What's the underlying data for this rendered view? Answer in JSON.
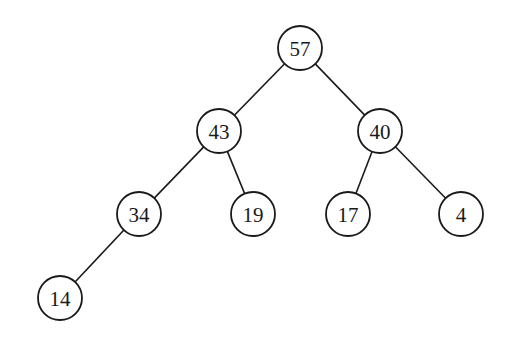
{
  "diagram": {
    "type": "binary-tree",
    "style": {
      "stroke_color": "#1a1a1a",
      "fill_color": "#ffffff",
      "background": "#ffffff",
      "node_radius": 22
    },
    "nodes": [
      {
        "id": "n57",
        "label": "57",
        "x": 300,
        "y": 48
      },
      {
        "id": "n43",
        "label": "43",
        "x": 219,
        "y": 131
      },
      {
        "id": "n40",
        "label": "40",
        "x": 380,
        "y": 131
      },
      {
        "id": "n34",
        "label": "34",
        "x": 139,
        "y": 214
      },
      {
        "id": "n19",
        "label": "19",
        "x": 253,
        "y": 214
      },
      {
        "id": "n17",
        "label": "17",
        "x": 348,
        "y": 214
      },
      {
        "id": "n4",
        "label": "4",
        "x": 461,
        "y": 214
      },
      {
        "id": "n14",
        "label": "14",
        "x": 60,
        "y": 298
      }
    ],
    "edges": [
      {
        "from": "n57",
        "to": "n43"
      },
      {
        "from": "n57",
        "to": "n40"
      },
      {
        "from": "n43",
        "to": "n34"
      },
      {
        "from": "n43",
        "to": "n19"
      },
      {
        "from": "n40",
        "to": "n17"
      },
      {
        "from": "n40",
        "to": "n4"
      },
      {
        "from": "n34",
        "to": "n14"
      }
    ]
  }
}
